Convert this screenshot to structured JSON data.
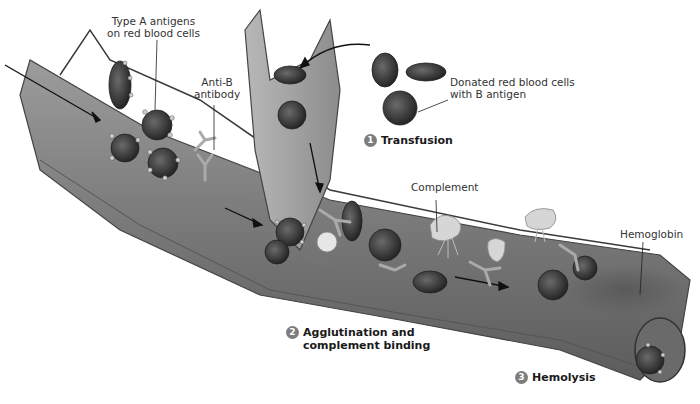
{
  "figure": {
    "colors": {
      "vessel": "#8a8a8a",
      "vessel_dark": "#5a5a5a",
      "cell": "#3c3c3c",
      "complement": "#d6d6d6",
      "step_badge": "#7d7d7d"
    }
  },
  "labels": {
    "type_a_antigens": "Type A antigens\non red blood cells",
    "anti_b_antibody": "Anti-B\nantibody",
    "donated_cells": "Donated red blood cells\nwith B antigen",
    "complement": "Complement",
    "hemoglobin": "Hemoglobin"
  },
  "steps": [
    {
      "number": "1",
      "label": "Transfusion"
    },
    {
      "number": "2",
      "label": "Agglutination and\ncomplement binding"
    },
    {
      "number": "3",
      "label": "Hemolysis"
    }
  ]
}
